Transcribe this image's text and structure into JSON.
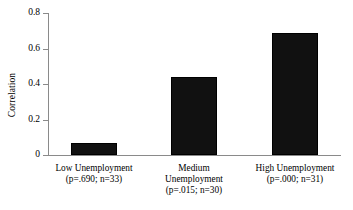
{
  "chart_data": {
    "type": "bar",
    "title": "",
    "xlabel": "",
    "ylabel": "Correlation",
    "categories": [
      "Low Unemployment\n(p=.690; n=33)",
      "Medium\nUnemployment\n(p=.015; n=30)",
      "High Unemployment\n(p=.000; n=31)"
    ],
    "category_names": [
      "Low Unemployment",
      "Medium Unemployment",
      "High Unemployment"
    ],
    "p_values": [
      ".690",
      ".015",
      ".000"
    ],
    "sample_sizes": [
      33,
      30,
      31
    ],
    "values": [
      0.07,
      0.44,
      0.69
    ],
    "ylim": [
      0,
      0.8
    ],
    "yticks": [
      "0",
      "0.2",
      "0.4",
      "0.6",
      "0.8"
    ],
    "ytick_values": [
      0,
      0.2,
      0.4,
      0.6,
      0.8
    ],
    "grid": false,
    "legend": false,
    "bar_color": "#111111",
    "axis_color": "#8a8a8a"
  }
}
